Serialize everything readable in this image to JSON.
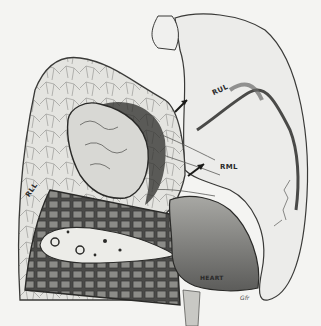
{
  "figure": {
    "type": "anatomical illustration",
    "labels": {
      "rul": "RUL",
      "rml": "RML",
      "rll": "RLL",
      "heart": "HEART"
    },
    "signature": "Gfr",
    "colors": {
      "background": "#f4f4f2",
      "ink": "#2a2a2a",
      "lung_fill": "#e2e2df",
      "section_fill": "#5a5a58",
      "heart_fill": "#8a8a88"
    }
  }
}
